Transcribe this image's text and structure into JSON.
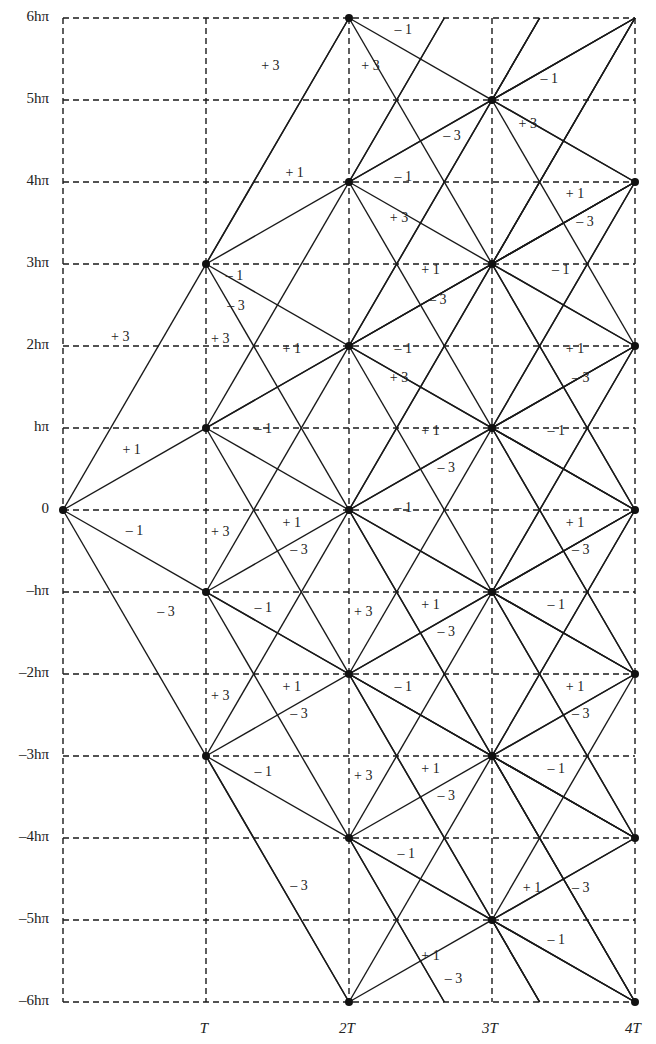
{
  "chart_data": {
    "type": "diagram",
    "title": "",
    "x_axis": {
      "ticks": [
        {
          "value": 1,
          "label": "T"
        },
        {
          "value": 2,
          "label": "2T"
        },
        {
          "value": 3,
          "label": "3T"
        },
        {
          "value": 4,
          "label": "4T"
        }
      ],
      "range": [
        0,
        4
      ]
    },
    "y_axis": {
      "ticks": [
        {
          "value": 6,
          "label": "6hπ"
        },
        {
          "value": 5,
          "label": "5hπ"
        },
        {
          "value": 4,
          "label": "4hπ"
        },
        {
          "value": 3,
          "label": "3hπ"
        },
        {
          "value": 2,
          "label": "2hπ"
        },
        {
          "value": 1,
          "label": "hπ"
        },
        {
          "value": 0,
          "label": "0"
        },
        {
          "value": -1,
          "label": "–hπ"
        },
        {
          "value": -2,
          "label": "–2hπ"
        },
        {
          "value": -3,
          "label": "–3hπ"
        },
        {
          "value": -4,
          "label": "–4hπ"
        },
        {
          "value": -5,
          "label": "–5hπ"
        },
        {
          "value": -6,
          "label": "–6hπ"
        }
      ],
      "range": [
        -6,
        6
      ]
    },
    "slopes": [
      3,
      1,
      -1,
      -3
    ],
    "nodes": [
      [
        0,
        0
      ],
      [
        1,
        3
      ],
      [
        1,
        1
      ],
      [
        1,
        -1
      ],
      [
        1,
        -3
      ],
      [
        2,
        6
      ],
      [
        2,
        4
      ],
      [
        2,
        2
      ],
      [
        2,
        0
      ],
      [
        2,
        -2
      ],
      [
        2,
        -4
      ],
      [
        2,
        -6
      ],
      [
        3,
        5
      ],
      [
        3,
        3
      ],
      [
        3,
        1
      ],
      [
        3,
        -1
      ],
      [
        3,
        -3
      ],
      [
        3,
        -5
      ],
      [
        4,
        4
      ],
      [
        4,
        2
      ],
      [
        4,
        0
      ],
      [
        4,
        -2
      ],
      [
        4,
        -4
      ],
      [
        4,
        -6
      ]
    ],
    "segment_labels": [
      {
        "x": 1.45,
        "y": 5.4,
        "text": "+ 3"
      },
      {
        "x": 2.15,
        "y": 5.4,
        "text": "+ 3"
      },
      {
        "x": 2.38,
        "y": 5.85,
        "text": "– 1"
      },
      {
        "x": 2.72,
        "y": 4.55,
        "text": "– 3"
      },
      {
        "x": 1.62,
        "y": 4.1,
        "text": "+ 1"
      },
      {
        "x": 2.38,
        "y": 4.05,
        "text": "– 1"
      },
      {
        "x": 2.35,
        "y": 3.55,
        "text": "+ 3"
      },
      {
        "x": 3.4,
        "y": 5.25,
        "text": "– 1"
      },
      {
        "x": 3.25,
        "y": 4.7,
        "text": "+ 3"
      },
      {
        "x": 3.58,
        "y": 3.85,
        "text": "+ 1"
      },
      {
        "x": 3.65,
        "y": 3.5,
        "text": "– 3"
      },
      {
        "x": 1.2,
        "y": 2.85,
        "text": "– 1"
      },
      {
        "x": 1.21,
        "y": 2.48,
        "text": "– 3"
      },
      {
        "x": 2.57,
        "y": 2.92,
        "text": "+ 1"
      },
      {
        "x": 3.48,
        "y": 2.92,
        "text": "– 1"
      },
      {
        "x": 0.4,
        "y": 2.1,
        "text": "+ 3"
      },
      {
        "x": 1.1,
        "y": 2.08,
        "text": "+ 3"
      },
      {
        "x": 1.6,
        "y": 1.95,
        "text": "+ 1"
      },
      {
        "x": 2.62,
        "y": 2.55,
        "text": "– 3"
      },
      {
        "x": 2.38,
        "y": 1.95,
        "text": "– 1"
      },
      {
        "x": 2.35,
        "y": 1.6,
        "text": "+ 3"
      },
      {
        "x": 3.58,
        "y": 1.95,
        "text": "+ 1"
      },
      {
        "x": 3.62,
        "y": 1.6,
        "text": "– 3"
      },
      {
        "x": 0.48,
        "y": 0.72,
        "text": "+ 1"
      },
      {
        "x": 1.4,
        "y": 0.98,
        "text": "– 1"
      },
      {
        "x": 2.57,
        "y": 0.95,
        "text": "+ 1"
      },
      {
        "x": 3.45,
        "y": 0.95,
        "text": "– 1"
      },
      {
        "x": 2.68,
        "y": 0.5,
        "text": "– 3"
      },
      {
        "x": 0.5,
        "y": -0.27,
        "text": "– 1"
      },
      {
        "x": 1.1,
        "y": -0.28,
        "text": "+ 3"
      },
      {
        "x": 1.6,
        "y": -0.17,
        "text": "+ 1"
      },
      {
        "x": 1.65,
        "y": -0.5,
        "text": "– 3"
      },
      {
        "x": 2.38,
        "y": 0.02,
        "text": "– 1"
      },
      {
        "x": 3.58,
        "y": -0.17,
        "text": "+ 1"
      },
      {
        "x": 3.62,
        "y": -0.5,
        "text": "– 3"
      },
      {
        "x": 0.72,
        "y": -1.25,
        "text": "– 3"
      },
      {
        "x": 1.4,
        "y": -1.2,
        "text": "– 1"
      },
      {
        "x": 2.1,
        "y": -1.25,
        "text": "+ 3"
      },
      {
        "x": 2.57,
        "y": -1.17,
        "text": "+ 1"
      },
      {
        "x": 2.68,
        "y": -1.5,
        "text": "– 3"
      },
      {
        "x": 3.45,
        "y": -1.17,
        "text": "– 1"
      },
      {
        "x": 1.1,
        "y": -2.28,
        "text": "+ 3"
      },
      {
        "x": 1.6,
        "y": -2.17,
        "text": "+ 1"
      },
      {
        "x": 1.65,
        "y": -2.5,
        "text": "– 3"
      },
      {
        "x": 2.38,
        "y": -2.17,
        "text": "– 1"
      },
      {
        "x": 3.58,
        "y": -2.17,
        "text": "+ 1"
      },
      {
        "x": 3.62,
        "y": -2.5,
        "text": "– 3"
      },
      {
        "x": 1.4,
        "y": -3.2,
        "text": "– 1"
      },
      {
        "x": 2.1,
        "y": -3.25,
        "text": "+ 3"
      },
      {
        "x": 2.57,
        "y": -3.17,
        "text": "+ 1"
      },
      {
        "x": 2.68,
        "y": -3.5,
        "text": "– 3"
      },
      {
        "x": 3.45,
        "y": -3.17,
        "text": "– 1"
      },
      {
        "x": 2.4,
        "y": -4.2,
        "text": "– 1"
      },
      {
        "x": 3.28,
        "y": -4.62,
        "text": "+ 1"
      },
      {
        "x": 3.62,
        "y": -4.62,
        "text": "– 3"
      },
      {
        "x": 1.65,
        "y": -4.6,
        "text": "– 3"
      },
      {
        "x": 2.57,
        "y": -5.45,
        "text": "+ 1"
      },
      {
        "x": 3.45,
        "y": -5.25,
        "text": "– 1"
      },
      {
        "x": 2.73,
        "y": -5.73,
        "text": "– 3"
      }
    ]
  }
}
